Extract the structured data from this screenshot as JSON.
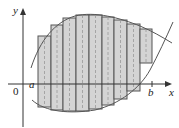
{
  "diagram": {
    "labels": {
      "y_axis": "y",
      "x_axis": "x",
      "origin": "0",
      "a": "a",
      "b": "b"
    },
    "colors": {
      "bar_fill": "#d4d4d4",
      "bar_stroke": "#555555",
      "axis": "#333333",
      "curve": "#555555",
      "midline": "#999999"
    },
    "bars": [
      {
        "x0": 38,
        "x1": 51,
        "top": 36,
        "bottom": 107
      },
      {
        "x0": 51,
        "x1": 63,
        "top": 25,
        "bottom": 110
      },
      {
        "x0": 63,
        "x1": 76,
        "top": 18,
        "bottom": 111
      },
      {
        "x0": 76,
        "x1": 89,
        "top": 15,
        "bottom": 111
      },
      {
        "x0": 89,
        "x1": 102,
        "top": 15,
        "bottom": 109
      },
      {
        "x0": 102,
        "x1": 114,
        "top": 17,
        "bottom": 105
      },
      {
        "x0": 114,
        "x1": 127,
        "top": 20,
        "bottom": 99
      },
      {
        "x0": 127,
        "x1": 140,
        "top": 24,
        "bottom": 91
      },
      {
        "x0": 140,
        "x1": 152,
        "top": 29,
        "bottom": 63
      }
    ]
  }
}
